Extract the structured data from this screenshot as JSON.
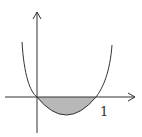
{
  "diagram": {
    "type": "function-graph",
    "x_tick_label": "1",
    "colors": {
      "stroke": "#333333",
      "shade": "#b8b8b8",
      "background": "#ffffff"
    }
  }
}
